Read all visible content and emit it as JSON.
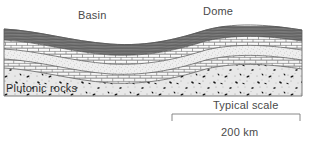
{
  "figure": {
    "type": "geologic-cross-section",
    "title_labels": {
      "basin": "Basin",
      "dome": "Dome",
      "plutonic": "Plutonic rocks"
    },
    "scale_bar": {
      "caption": "Typical scale",
      "length_label": "200 km",
      "bar_start_x": 172,
      "bar_end_x": 300,
      "bar_y": 114
    },
    "block": {
      "left": 4,
      "right": 302,
      "top": 28,
      "bottom": 96
    },
    "layers": [
      {
        "name": "shale-upper",
        "pattern": "dark-horizontal-lines",
        "color": "#7d7d7d"
      },
      {
        "name": "limestone-upper",
        "pattern": "brick",
        "color": "#ffffff"
      },
      {
        "name": "sandstone-middle",
        "pattern": "stipple-fine",
        "color": "#eeeeee"
      },
      {
        "name": "limestone-lower",
        "pattern": "brick",
        "color": "#f6f6f6"
      },
      {
        "name": "plutonic-basement",
        "pattern": "speckled-coarse",
        "color": "#e4e4e4"
      }
    ],
    "colors": {
      "shale": "#7d7d7d",
      "shale_line": "#4a4a4a",
      "brick_line": "#5a5a5a",
      "sand": "#ededed",
      "pluton": "#e6e6e6",
      "speck": "#1a1a1a",
      "outline": "#555555",
      "text": "#4a4a4a",
      "rule": "#808080"
    },
    "structures": [
      {
        "name": "basin",
        "kind": "syncline-downwarp",
        "center_x": 110
      },
      {
        "name": "dome",
        "kind": "anticline-upwarp",
        "center_x": 228
      }
    ]
  }
}
